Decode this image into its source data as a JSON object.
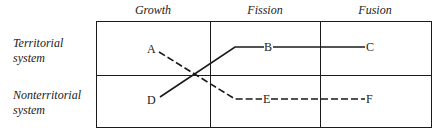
{
  "columns": [
    "Growth",
    "Fission",
    "Fusion"
  ],
  "rows": [
    {
      "line1": "Territorial",
      "line2": "system"
    },
    {
      "line1": "Nonterritorial",
      "line2": "system"
    }
  ],
  "nodes": {
    "A": "A",
    "B": "B",
    "C": "C",
    "D": "D",
    "E": "E",
    "F": "F"
  },
  "paths": [
    {
      "from": "D",
      "to": "B",
      "via": "C",
      "style": "solid"
    },
    {
      "from": "A",
      "to": "E",
      "via": "F",
      "style": "dashed"
    }
  ]
}
